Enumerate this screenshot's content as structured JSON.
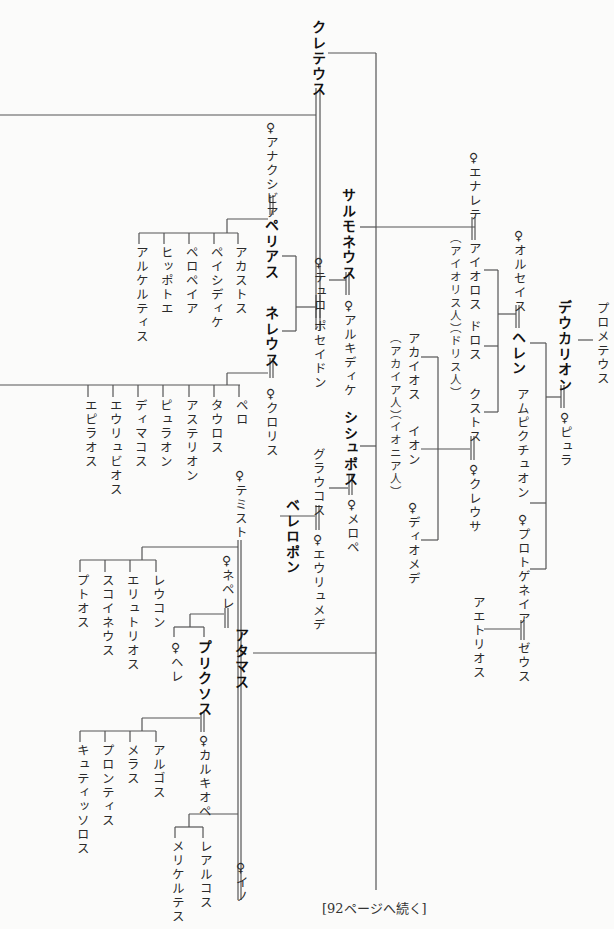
{
  "legend": {
    "female_mark": "♀"
  },
  "persons": {
    "kreteus": "クレテウス",
    "anaxibia": "♀アナクシビア",
    "pelias": "ペリアス",
    "akastos": "アカストス",
    "peisidike": "ペイシディケ",
    "pelopeia": "ペロペイア",
    "hippothoe": "ヒッポトエ",
    "alkestis": "アルケルティス",
    "neleus": "ネレウス",
    "tyro": "♀テュロ",
    "poseidon": "ポセイドン",
    "chloris": "♀クロリス",
    "pero": "ペロ",
    "tauros": "タウロス",
    "asterion": "アステリオン",
    "pylaon": "ピュラオン",
    "deimachos": "ディマコス",
    "eurybios": "エウリュビオス",
    "epilaos": "エピラオス",
    "salmoneus": "サルモネウス",
    "alkidike": "♀アルキディケ",
    "enarete": "♀エナレテ",
    "aiolos": "アイオロス",
    "aiolians": "（アイオリス人）",
    "doros": "ドロス",
    "dorians": "（ドリス人）",
    "xuthos": "クストス",
    "creusa": "♀クレウサ",
    "achaios": "アカイオス",
    "achaians": "（アカイア人）",
    "ion": "イオン",
    "ionians": "（イオニア人）",
    "diomede": "♀ディオメデ",
    "orseis": "♀オルセイス",
    "hellen": "ヘレン",
    "amphiktyon": "アムピクチュオン",
    "deukalion": "デウカリオン",
    "pyrrha": "♀ピュラ",
    "prometheus": "プロメテウス",
    "protogeneia": "♀プロトゲネイア",
    "zeus": "ゼウス",
    "aethlios": "アエトリオス",
    "sisyphos": "シシュポス",
    "merope": "♀メロペ",
    "glaukos": "グラウコス",
    "eurymede": "♀エウリュメデ",
    "bellerophon": "ベレロポン",
    "themisto": "♀テミスト",
    "leukon": "レウコン",
    "erythrios": "エリュトリオス",
    "schoineus": "スコイネウス",
    "ptoos": "プトオス",
    "nephele": "♀ネペレ",
    "helle": "♀ヘレ",
    "phrixos": "プリクソス",
    "athamas": "アタマス",
    "chalkiope": "♀カルキオペ",
    "argos": "アルゴス",
    "melas": "メラス",
    "phrontis": "プロンティス",
    "kytissoros": "キュティッソロス",
    "learchos": "レアルコス",
    "melikertes": "メリケルテス",
    "ino": "♀イノ"
  },
  "footer": {
    "continued": "[92ページへ続く]"
  }
}
